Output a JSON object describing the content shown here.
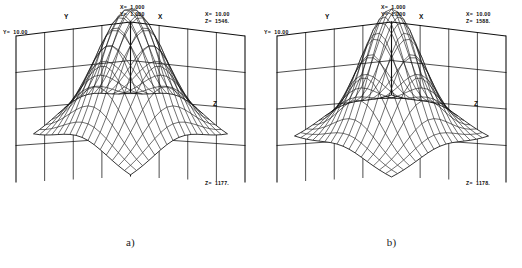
{
  "figure": {
    "title": "",
    "panels": [
      {
        "id": "a",
        "caption": "a)",
        "annotations": {
          "top_center_line1": "X=  1.000",
          "top_center_line2": "Y=  1.000",
          "top_right_line1": "X=  10.00",
          "top_right_line2": "Z=  1546.",
          "left": "Y=  10.00",
          "bottom_right": "Z=  1177."
        },
        "axis_labels": {
          "y": "Y",
          "x": "X",
          "z": "Z"
        }
      },
      {
        "id": "b",
        "caption": "b)",
        "annotations": {
          "top_center_line1": "X=  1.000",
          "top_center_line2": "Y=  1.000",
          "top_right_line1": "X=  10.00",
          "top_right_line2": "Z=  1588.",
          "left": "Y=  10.00",
          "bottom_right": "Z=  1178."
        },
        "axis_labels": {
          "y": "Y",
          "x": "X",
          "z": "Z"
        }
      }
    ]
  },
  "chart_data": [
    {
      "type": "line",
      "subtype": "surface-mesh-3d",
      "title": "a)",
      "xlabel": "X",
      "ylabel": "Y",
      "zlabel": "Z",
      "xlim": [
        1.0,
        10.0
      ],
      "ylim": [
        1.0,
        10.0
      ],
      "zlim": [
        1177,
        1546
      ],
      "grid": true,
      "legend": "none",
      "tick_labels": {
        "x": [
          "1.000",
          "10.00"
        ],
        "y": [
          "1.000",
          "10.00"
        ],
        "z": [
          "1177.",
          "1546."
        ]
      },
      "mesh": {
        "rows": 17,
        "cols": 17,
        "peak_shape": "gaussian",
        "peak_sigma": 0.26,
        "peak_height": 1.0,
        "base_level": 0.0
      },
      "annotations": [
        "X=  1.000",
        "Y=  1.000",
        "X=  10.00",
        "Z=  1546.",
        "Y=  10.00",
        "Z=  1177."
      ]
    },
    {
      "type": "line",
      "subtype": "surface-mesh-3d",
      "title": "b)",
      "xlabel": "X",
      "ylabel": "Y",
      "zlabel": "Z",
      "xlim": [
        1.0,
        10.0
      ],
      "ylim": [
        1.0,
        10.0
      ],
      "zlim": [
        1178,
        1588
      ],
      "grid": true,
      "legend": "none",
      "tick_labels": {
        "x": [
          "1.000",
          "10.00"
        ],
        "y": [
          "1.000",
          "10.00"
        ],
        "z": [
          "1178.",
          "1588."
        ]
      },
      "mesh": {
        "rows": 17,
        "cols": 17,
        "peak_shape": "gaussian-sharp",
        "peak_sigma": 0.22,
        "peak_height": 1.0,
        "base_level": 0.0
      },
      "annotations": [
        "X=  1.000",
        "Y=  1.000",
        "X=  10.00",
        "Z=  1588.",
        "Y=  10.00",
        "Z=  1178."
      ]
    }
  ],
  "colors": {
    "ink": "#111111",
    "background": "#ffffff",
    "grid": "#1a1a1a"
  }
}
